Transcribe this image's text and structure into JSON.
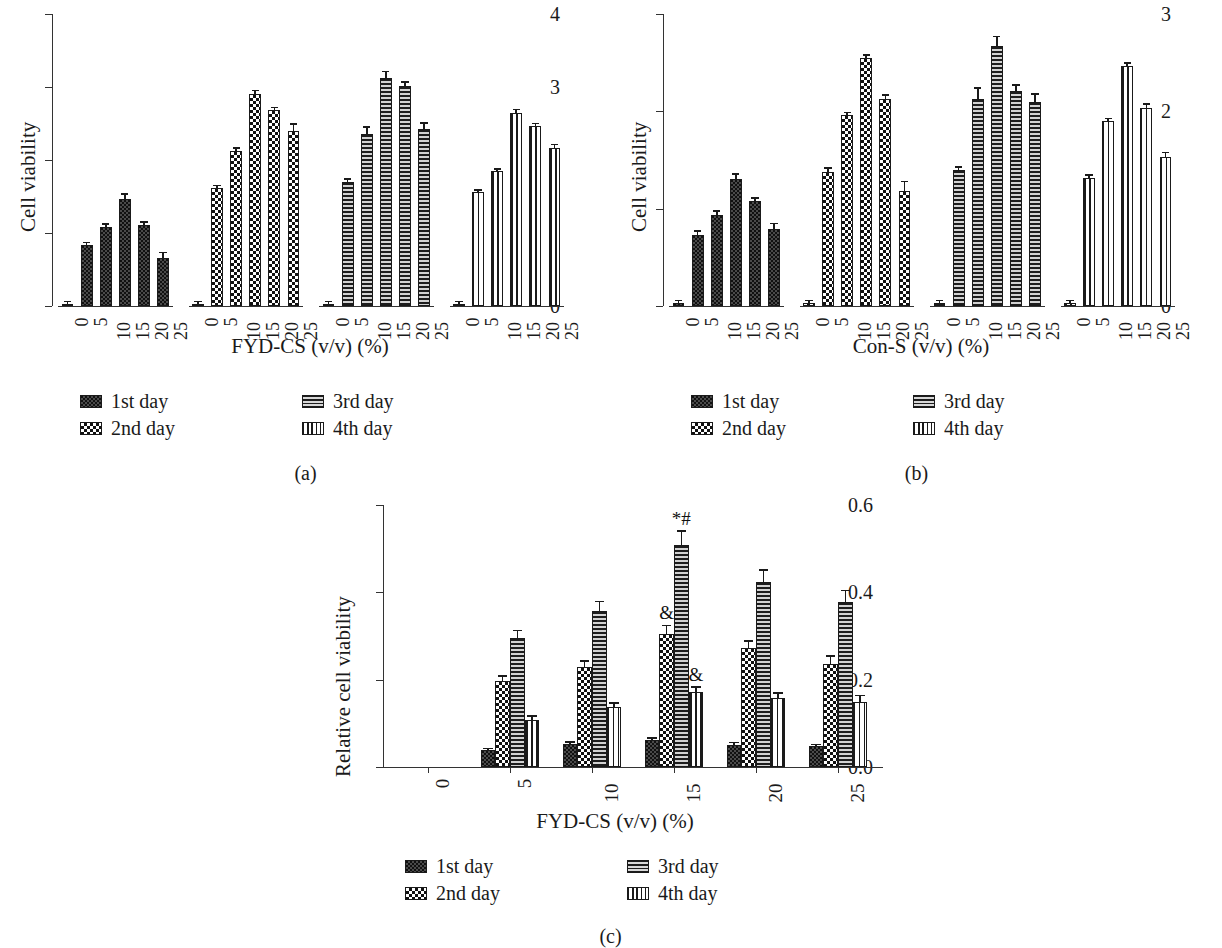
{
  "figure": {
    "panels": [
      {
        "id": "a",
        "caption": "(a)"
      },
      {
        "id": "b",
        "caption": "(b)"
      },
      {
        "id": "c",
        "caption": "(c)"
      }
    ]
  },
  "legend": {
    "items": [
      {
        "key": "d1",
        "label": "1st day",
        "pattern": "dotted-dark"
      },
      {
        "key": "d2",
        "label": "2nd day",
        "pattern": "checkerboard"
      },
      {
        "key": "d3",
        "label": "3rd day",
        "pattern": "horizontal-lines"
      },
      {
        "key": "d4",
        "label": "4th day",
        "pattern": "vertical-lines"
      }
    ]
  },
  "chart_data": [
    {
      "panel": "a",
      "type": "bar",
      "title": "",
      "xlabel": "FYD-CS (v/v) (%)",
      "ylabel": "Cell viability",
      "ylim": [
        0,
        4
      ],
      "yticks": [
        "0",
        "1",
        "2",
        "3",
        "4"
      ],
      "grid": false,
      "legend_position": "below",
      "group_layout": "series-blocks",
      "categories": [
        "0",
        "5",
        "10",
        "15",
        "20",
        "25"
      ],
      "series": [
        {
          "name": "1st day",
          "values": [
            0.03,
            0.83,
            1.08,
            1.46,
            1.11,
            0.66
          ],
          "errors": [
            0.02,
            0.03,
            0.03,
            0.06,
            0.03,
            0.06
          ]
        },
        {
          "name": "2nd day",
          "values": [
            0.03,
            1.61,
            2.12,
            2.91,
            2.68,
            2.4
          ],
          "errors": [
            0.02,
            0.03,
            0.03,
            0.03,
            0.03,
            0.08
          ]
        },
        {
          "name": "3rd day",
          "values": [
            0.03,
            1.7,
            2.36,
            3.12,
            3.02,
            2.43
          ],
          "errors": [
            0.02,
            0.03,
            0.08,
            0.08,
            0.04,
            0.07
          ]
        },
        {
          "name": "4th day",
          "values": [
            0.03,
            1.56,
            1.85,
            2.65,
            2.46,
            2.17
          ],
          "errors": [
            0.02,
            0.02,
            0.02,
            0.03,
            0.03,
            0.03
          ]
        }
      ]
    },
    {
      "panel": "b",
      "type": "bar",
      "title": "",
      "xlabel": "Con-S (v/v) (%)",
      "ylabel": "Cell viability",
      "ylim": [
        0,
        3
      ],
      "yticks": [
        "0",
        "1",
        "2",
        "3"
      ],
      "grid": false,
      "legend_position": "below",
      "group_layout": "series-blocks",
      "categories": [
        "0",
        "5",
        "10",
        "15",
        "20",
        "25"
      ],
      "series": [
        {
          "name": "1st day",
          "values": [
            0.03,
            0.73,
            0.94,
            1.3,
            1.08,
            0.79
          ],
          "errors": [
            0.02,
            0.03,
            0.03,
            0.05,
            0.02,
            0.05
          ]
        },
        {
          "name": "2nd day",
          "values": [
            0.03,
            1.38,
            1.96,
            2.55,
            2.13,
            1.18
          ],
          "errors": [
            0.02,
            0.03,
            0.02,
            0.02,
            0.03,
            0.09
          ]
        },
        {
          "name": "3rd day",
          "values": [
            0.03,
            1.4,
            2.13,
            2.67,
            2.21,
            2.1
          ],
          "errors": [
            0.02,
            0.02,
            0.1,
            0.09,
            0.05,
            0.07
          ]
        },
        {
          "name": "4th day",
          "values": [
            0.03,
            1.32,
            1.9,
            2.47,
            2.03,
            1.53
          ],
          "errors": [
            0.02,
            0.02,
            0.02,
            0.02,
            0.04,
            0.04
          ]
        }
      ]
    },
    {
      "panel": "c",
      "type": "bar",
      "title": "",
      "xlabel": "FYD-CS (v/v) (%)",
      "ylabel": "Relative cell viability",
      "ylim": [
        0.0,
        0.6
      ],
      "yticks": [
        "0.0",
        "0.2",
        "0.4",
        "0.6"
      ],
      "grid": false,
      "legend_position": "below",
      "group_layout": "grouped",
      "categories": [
        "0",
        "5",
        "10",
        "15",
        "20",
        "25"
      ],
      "series": [
        {
          "name": "1st day",
          "values": [
            0.0,
            0.038,
            0.052,
            0.061,
            0.051,
            0.047
          ],
          "errors": [
            0,
            0.003,
            0.003,
            0.003,
            0.003,
            0.003
          ]
        },
        {
          "name": "2nd day",
          "values": [
            0.0,
            0.196,
            0.228,
            0.304,
            0.272,
            0.236
          ],
          "errors": [
            0,
            0.01,
            0.013,
            0.018,
            0.015,
            0.016
          ]
        },
        {
          "name": "3rd day",
          "values": [
            0.0,
            0.295,
            0.357,
            0.508,
            0.424,
            0.377
          ],
          "errors": [
            0,
            0.016,
            0.02,
            0.03,
            0.026,
            0.025
          ]
        },
        {
          "name": "4th day",
          "values": [
            0.0,
            0.107,
            0.137,
            0.172,
            0.157,
            0.15
          ],
          "errors": [
            0,
            0.008,
            0.008,
            0.01,
            0.01,
            0.012
          ]
        }
      ],
      "annotations": [
        {
          "text": "*#",
          "category": "15",
          "series": "3rd day"
        },
        {
          "text": "&",
          "category": "15",
          "series": "2nd day"
        },
        {
          "text": "&",
          "category": "15",
          "series": "4th day"
        }
      ]
    }
  ]
}
